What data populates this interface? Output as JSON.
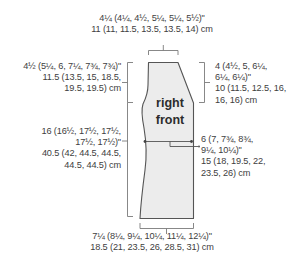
{
  "diagram": {
    "title": "right front",
    "title_lines": [
      "right",
      "front"
    ],
    "colors": {
      "fill": "#ececec",
      "outline": "#555555",
      "measure_lines": "#7a7a7a",
      "text": "#404040"
    },
    "measurements": {
      "top_shoulder": {
        "lines": [
          "4¼ (4¼, 4½, 5¼, 5¼, 5½)\"",
          "11 (11, 11.5, 13.5, 13.5, 14) cm"
        ]
      },
      "armhole_depth": {
        "lines": [
          "4½ (5¼, 6, 7¼, 7¾, 7¾)\"",
          "11.5 (13.5, 15, 18.5,",
          "19.5, 19.5) cm"
        ]
      },
      "length_to_armhole": {
        "lines": [
          "16 (16½, 17½, 17½,",
          "17½, 17½)\"",
          "40.5 (42, 44.5, 44.5,",
          "44.5, 44.5) cm"
        ]
      },
      "neck_depth": {
        "lines": [
          "4 (4½, 5, 6¼,",
          "6¼, 6¼)\"",
          "10 (11.5, 12.5, 16,",
          "16, 16) cm"
        ]
      },
      "waist_width": {
        "lines": [
          "6 (7, 7¾, 8¾,",
          "9¼, 10¼)\"",
          "15 (18, 19.5, 22,",
          "23.5, 26) cm"
        ]
      },
      "bottom_width": {
        "lines": [
          "7¼ (8¼, 9¼, 10¼, 11¼, 12¼)\"",
          "18.5 (21, 23.5, 26, 28.5, 31) cm"
        ]
      }
    }
  }
}
